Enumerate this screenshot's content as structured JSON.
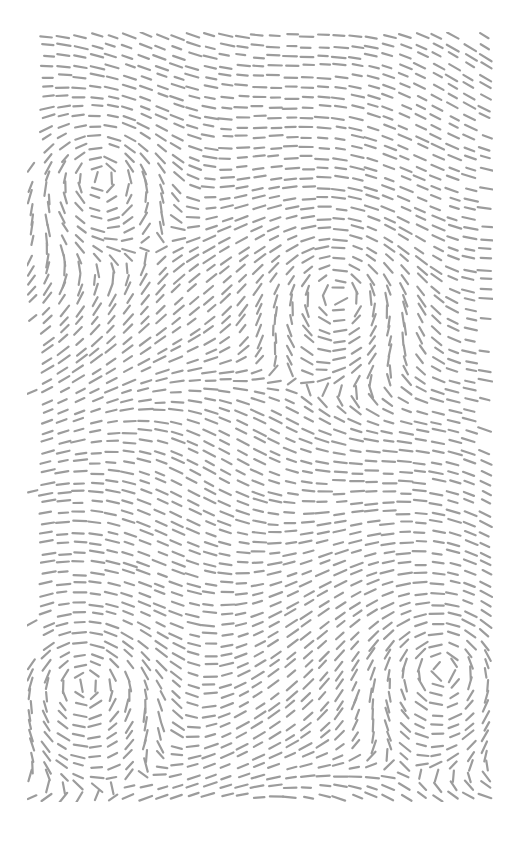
{
  "artwork": {
    "type": "flow-field-dashes",
    "background": "#ffffff",
    "stroke_color": "#9c9c9c",
    "bounds": {
      "x": 27,
      "y": 32,
      "width": 466,
      "height": 770
    },
    "dash": {
      "length": 12,
      "width": 2.2,
      "spacing": 13
    },
    "vortices": [
      {
        "x": 73,
        "y": 146,
        "strength": 1.0
      },
      {
        "x": 311,
        "y": 263,
        "strength": 1.0
      },
      {
        "x": 58,
        "y": 653,
        "strength": 1.0
      },
      {
        "x": 415,
        "y": 638,
        "strength": 1.0
      }
    ],
    "base_flow_angle_deg": 0
  }
}
